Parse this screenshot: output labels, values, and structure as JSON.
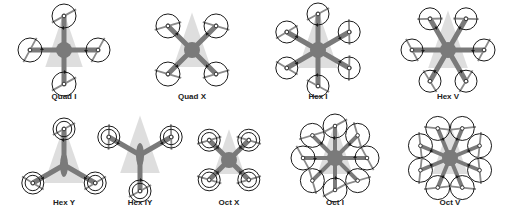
{
  "colors": {
    "frame": "#7a7a7a",
    "motor_ring": "#1a1a1a",
    "heading_cone": "#d6d6d6",
    "prop": "#8a8a8a",
    "label": "#222222",
    "background": "#ffffff"
  },
  "frames": [
    {
      "id": "quad-i",
      "label": "Quad I",
      "cx": 64,
      "cy": 50,
      "label_x": 64,
      "label_y": 97,
      "arms": 4,
      "start_angle": -90,
      "arm_len": 34,
      "prop_r": 12,
      "coaxial": false,
      "shape": "star"
    },
    {
      "id": "quad-x",
      "label": "Quad X",
      "cx": 192,
      "cy": 50,
      "label_x": 192,
      "label_y": 97,
      "arms": 4,
      "start_angle": -45,
      "arm_len": 34,
      "prop_r": 12,
      "coaxial": false,
      "shape": "star"
    },
    {
      "id": "hex-i",
      "label": "Hex I",
      "cx": 318,
      "cy": 50,
      "label_x": 318,
      "label_y": 97,
      "arms": 6,
      "start_angle": -90,
      "arm_len": 36,
      "prop_r": 11,
      "coaxial": false,
      "shape": "star"
    },
    {
      "id": "hex-v",
      "label": "Hex V",
      "cx": 448,
      "cy": 50,
      "label_x": 448,
      "label_y": 97,
      "arms": 6,
      "start_angle": -60,
      "arm_len": 36,
      "prop_r": 11,
      "coaxial": false,
      "shape": "star"
    },
    {
      "id": "hex-y",
      "label": "Hex Y",
      "cx": 64,
      "cy": 165,
      "label_x": 64,
      "label_y": 203,
      "arms": 3,
      "start_angle": -90,
      "arm_len": 36,
      "prop_r": 11,
      "coaxial": true,
      "shape": "y"
    },
    {
      "id": "hex-iy",
      "label": "Hex IY",
      "cx": 140,
      "cy": 155,
      "label_x": 140,
      "label_y": 203,
      "arms": 3,
      "start_angle": -150,
      "arm_len": 36,
      "prop_r": 11,
      "coaxial": true,
      "shape": "iy"
    },
    {
      "id": "oct-x",
      "label": "Oct X",
      "cx": 229,
      "cy": 160,
      "label_x": 229,
      "label_y": 203,
      "arms": 4,
      "start_angle": -45,
      "arm_len": 28,
      "prop_r": 11,
      "coaxial": true,
      "shape": "star"
    },
    {
      "id": "oct-i",
      "label": "Oct I",
      "cx": 335,
      "cy": 158,
      "label_x": 335,
      "label_y": 203,
      "arms": 8,
      "start_angle": -90,
      "arm_len": 32,
      "prop_r": 12,
      "coaxial": false,
      "shape": "star"
    },
    {
      "id": "oct-v",
      "label": "Oct V",
      "cx": 450,
      "cy": 158,
      "label_x": 450,
      "label_y": 203,
      "arms": 8,
      "start_angle": -67.5,
      "arm_len": 32,
      "prop_r": 12,
      "coaxial": false,
      "shape": "star"
    }
  ]
}
